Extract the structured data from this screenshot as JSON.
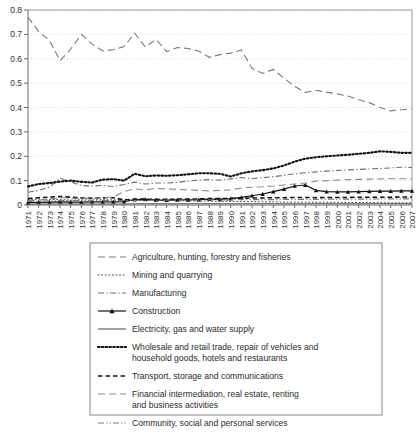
{
  "chart_data": {
    "type": "line",
    "title": "",
    "subtitle": "",
    "xlabel": "",
    "ylabel": "",
    "ylim": [
      0,
      0.8
    ],
    "yticks": [
      "0",
      "0.1",
      "0.2",
      "0.3",
      "0.4",
      "0.5",
      "0.6",
      "0.7",
      "0.8"
    ],
    "ytick_values": [
      0,
      0.1,
      0.2,
      0.3,
      0.4,
      0.5,
      0.6,
      0.7,
      0.8
    ],
    "grid": true,
    "grid_axis": "y",
    "legend_position": "bottom",
    "x": [
      1971,
      1972,
      1973,
      1974,
      1975,
      1976,
      1977,
      1978,
      1979,
      1980,
      1981,
      1982,
      1983,
      1984,
      1985,
      1986,
      1987,
      1988,
      1989,
      1990,
      1991,
      1992,
      1993,
      1994,
      1995,
      1996,
      1997,
      1998,
      1999,
      2000,
      2001,
      2002,
      2003,
      2004,
      2005,
      2006,
      2007
    ],
    "categories": [
      "1971",
      "1972",
      "1973",
      "1974",
      "1975",
      "1976",
      "1977",
      "1978",
      "1979",
      "1980",
      "1981",
      "1982",
      "1983",
      "1984",
      "1985",
      "1986",
      "1987",
      "1988",
      "1989",
      "1990",
      "1991",
      "1992",
      "1993",
      "1994",
      "1995",
      "1996",
      "1997",
      "1998",
      "1999",
      "2000",
      "2001",
      "2002",
      "2003",
      "2004",
      "2005",
      "2006",
      "2007"
    ],
    "series": [
      {
        "name": "Agriculture, hunting, forestry and fisheries",
        "style": "long-dash",
        "color": "#7a7a7a",
        "values": [
          0.77,
          0.712,
          0.676,
          0.592,
          0.639,
          0.7,
          0.661,
          0.632,
          0.637,
          0.65,
          0.705,
          0.648,
          0.68,
          0.629,
          0.646,
          0.642,
          0.632,
          0.606,
          0.617,
          0.623,
          0.636,
          0.561,
          0.54,
          0.556,
          0.52,
          0.487,
          0.462,
          0.47,
          0.463,
          0.456,
          0.447,
          0.432,
          0.42,
          0.4,
          0.386,
          0.391,
          0.394
        ]
      },
      {
        "name": "Mining and quarrying",
        "style": "fine-dot",
        "color": "#4a4a4a",
        "values": [
          0.022,
          0.024,
          0.023,
          0.022,
          0.02,
          0.021,
          0.021,
          0.022,
          0.021,
          0.02,
          0.02,
          0.019,
          0.019,
          0.018,
          0.018,
          0.017,
          0.016,
          0.016,
          0.015,
          0.015,
          0.014,
          0.014,
          0.013,
          0.013,
          0.012,
          0.012,
          0.012,
          0.011,
          0.011,
          0.011,
          0.01,
          0.01,
          0.01,
          0.01,
          0.009,
          0.009,
          0.009
        ]
      },
      {
        "name": "Manufacturing",
        "style": "dash-dot",
        "color": "#6e6e6e",
        "values": [
          0.052,
          0.06,
          0.073,
          0.11,
          0.095,
          0.08,
          0.078,
          0.08,
          0.076,
          0.084,
          0.094,
          0.086,
          0.09,
          0.09,
          0.093,
          0.098,
          0.102,
          0.104,
          0.102,
          0.107,
          0.113,
          0.108,
          0.112,
          0.116,
          0.122,
          0.128,
          0.132,
          0.136,
          0.139,
          0.142,
          0.144,
          0.146,
          0.148,
          0.15,
          0.152,
          0.155,
          0.154
        ]
      },
      {
        "name": "Construction",
        "style": "solid-triangle",
        "color": "#111111",
        "values": [
          0.01,
          0.011,
          0.012,
          0.013,
          0.012,
          0.012,
          0.013,
          0.013,
          0.013,
          0.014,
          0.022,
          0.023,
          0.021,
          0.02,
          0.021,
          0.021,
          0.022,
          0.024,
          0.023,
          0.026,
          0.031,
          0.038,
          0.045,
          0.055,
          0.065,
          0.078,
          0.082,
          0.06,
          0.055,
          0.054,
          0.054,
          0.055,
          0.056,
          0.057,
          0.057,
          0.058,
          0.058
        ]
      },
      {
        "name": "Electricity, gas and water supply",
        "style": "solid",
        "color": "#555555",
        "values": [
          0.004,
          0.004,
          0.004,
          0.004,
          0.004,
          0.004,
          0.004,
          0.004,
          0.004,
          0.004,
          0.005,
          0.005,
          0.005,
          0.005,
          0.005,
          0.005,
          0.005,
          0.005,
          0.005,
          0.005,
          0.005,
          0.005,
          0.005,
          0.005,
          0.005,
          0.005,
          0.005,
          0.005,
          0.005,
          0.005,
          0.005,
          0.005,
          0.005,
          0.005,
          0.005,
          0.005,
          0.005
        ]
      },
      {
        "name": "Wholesale and retail trade, repair of vehicles and household goods, hotels and restaurants",
        "style": "bold-dot",
        "color": "#111111",
        "values": [
          0.076,
          0.086,
          0.09,
          0.096,
          0.1,
          0.095,
          0.092,
          0.104,
          0.106,
          0.1,
          0.128,
          0.118,
          0.121,
          0.12,
          0.122,
          0.126,
          0.13,
          0.13,
          0.128,
          0.117,
          0.13,
          0.138,
          0.143,
          0.15,
          0.162,
          0.178,
          0.19,
          0.196,
          0.2,
          0.203,
          0.206,
          0.21,
          0.214,
          0.22,
          0.218,
          0.214,
          0.214
        ]
      },
      {
        "name": "Transport, storage and communications",
        "style": "med-dash",
        "color": "#111111",
        "values": [
          0.026,
          0.03,
          0.032,
          0.035,
          0.032,
          0.029,
          0.028,
          0.03,
          0.03,
          0.021,
          0.024,
          0.024,
          0.023,
          0.023,
          0.024,
          0.024,
          0.025,
          0.026,
          0.026,
          0.027,
          0.028,
          0.029,
          0.029,
          0.03,
          0.03,
          0.031,
          0.031,
          0.03,
          0.031,
          0.031,
          0.031,
          0.032,
          0.032,
          0.032,
          0.032,
          0.033,
          0.033
        ]
      },
      {
        "name": "Financial intermediation, real estate, renting and business activities",
        "style": "long-dash",
        "color": "#8a8a8a",
        "values": [
          0.018,
          0.02,
          0.024,
          0.03,
          0.028,
          0.027,
          0.028,
          0.03,
          0.032,
          0.055,
          0.066,
          0.062,
          0.068,
          0.066,
          0.064,
          0.062,
          0.06,
          0.058,
          0.06,
          0.062,
          0.07,
          0.073,
          0.075,
          0.078,
          0.082,
          0.086,
          0.09,
          0.098,
          0.1,
          0.102,
          0.104,
          0.105,
          0.106,
          0.107,
          0.108,
          0.108,
          0.108
        ]
      },
      {
        "name": "Community, social and personal services",
        "style": "dash-dot-dot",
        "color": "#777777",
        "values": [
          0.014,
          0.016,
          0.017,
          0.018,
          0.018,
          0.017,
          0.017,
          0.018,
          0.018,
          0.018,
          0.019,
          0.019,
          0.019,
          0.02,
          0.02,
          0.02,
          0.02,
          0.021,
          0.021,
          0.021,
          0.022,
          0.022,
          0.022,
          0.022,
          0.023,
          0.023,
          0.023,
          0.023,
          0.024,
          0.024,
          0.024,
          0.024,
          0.024,
          0.025,
          0.025,
          0.025,
          0.025
        ]
      }
    ],
    "legend": [
      {
        "label": "Agriculture, hunting, forestry and fisheries",
        "style": "long-dash"
      },
      {
        "label": "Mining and quarrying",
        "style": "fine-dot"
      },
      {
        "label": "Manufacturing",
        "style": "dash-dot"
      },
      {
        "label": "Construction",
        "style": "solid-triangle"
      },
      {
        "label": "Electricity, gas and water supply",
        "style": "solid"
      },
      {
        "label": "Wholesale and retail trade, repair of vehicles and",
        "label2": "household goods, hotels and restaurants",
        "style": "bold-dot"
      },
      {
        "label": "Transport, storage and communications",
        "style": "med-dash"
      },
      {
        "label": "Financial intermediation, real estate, renting",
        "label2": "and business activities",
        "style": "long-dash"
      },
      {
        "label": "Community, social and personal services",
        "style": "dash-dot-dot"
      }
    ]
  }
}
